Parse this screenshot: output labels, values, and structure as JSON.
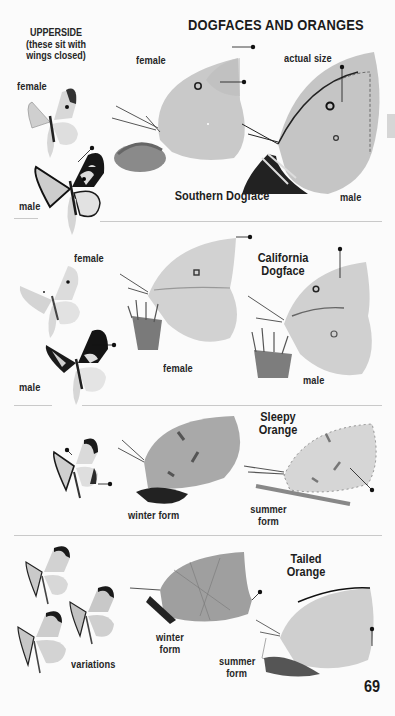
{
  "page": {
    "title": "DOGFACES AND ORANGES",
    "page_number": "69",
    "upperside_note": {
      "line1": "UPPERSIDE",
      "line2": "(these sit with",
      "line3": "wings closed)"
    }
  },
  "sections": [
    {
      "species": "Southern Dogface",
      "labels": {
        "upper_female": "female",
        "upper_male": "male",
        "side_female": "female",
        "actual_size": "actual size",
        "side_male": "male"
      }
    },
    {
      "species_line1": "California",
      "species_line2": "Dogface",
      "labels": {
        "upper_female": "female",
        "upper_male": "male",
        "side_female": "female",
        "side_male": "male"
      }
    },
    {
      "species_line1": "Sleepy",
      "species_line2": "Orange",
      "labels": {
        "winter": "winter form",
        "summer_line1": "summer",
        "summer_line2": "form"
      }
    },
    {
      "species_line1": "Tailed",
      "species_line2": "Orange",
      "labels": {
        "variations": "variations",
        "winter_line1": "winter",
        "winter_line2": "form",
        "summer_line1": "summer",
        "summer_line2": "form"
      }
    }
  ],
  "colors": {
    "background": "#fbfbfb",
    "wing_light": "#d9d9d9",
    "wing_mid": "#c4c4c4",
    "wing_dark": "#1e1e1e",
    "divider": "#c9c9c9",
    "side_tab": "#d6d6d6"
  }
}
